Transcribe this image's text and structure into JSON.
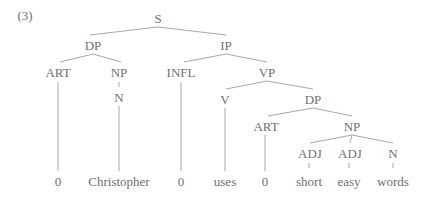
{
  "example_number": "(3)",
  "tree": {
    "nodes": [
      {
        "id": "S",
        "label": "S",
        "x": 158,
        "y": 18
      },
      {
        "id": "DP1",
        "label": "DP",
        "x": 93,
        "y": 45
      },
      {
        "id": "IP",
        "label": "IP",
        "x": 226,
        "y": 45
      },
      {
        "id": "ART1",
        "label": "ART",
        "x": 58,
        "y": 72
      },
      {
        "id": "NP1",
        "label": "NP",
        "x": 119,
        "y": 72
      },
      {
        "id": "N1",
        "label": "N",
        "x": 119,
        "y": 97
      },
      {
        "id": "INFL",
        "label": "INFL",
        "x": 181,
        "y": 72
      },
      {
        "id": "VP",
        "label": "VP",
        "x": 267,
        "y": 72
      },
      {
        "id": "V",
        "label": "V",
        "x": 225,
        "y": 99
      },
      {
        "id": "DP2",
        "label": "DP",
        "x": 313,
        "y": 99
      },
      {
        "id": "ART2",
        "label": "ART",
        "x": 266,
        "y": 126
      },
      {
        "id": "NP2",
        "label": "NP",
        "x": 352,
        "y": 126
      },
      {
        "id": "ADJ1",
        "label": "ADJ",
        "x": 310,
        "y": 153
      },
      {
        "id": "ADJ2",
        "label": "ADJ",
        "x": 350,
        "y": 153
      },
      {
        "id": "N2",
        "label": "N",
        "x": 393,
        "y": 153
      },
      {
        "id": "w1",
        "label": "0",
        "x": 58,
        "y": 181
      },
      {
        "id": "w2",
        "label": "Christopher",
        "x": 119,
        "y": 181
      },
      {
        "id": "w3",
        "label": "0",
        "x": 181,
        "y": 181
      },
      {
        "id": "w4",
        "label": "uses",
        "x": 225,
        "y": 181
      },
      {
        "id": "w5",
        "label": "0",
        "x": 265,
        "y": 181
      },
      {
        "id": "w6",
        "label": "short",
        "x": 309,
        "y": 181
      },
      {
        "id": "w7",
        "label": "easy",
        "x": 349,
        "y": 181
      },
      {
        "id": "w8",
        "label": "words",
        "x": 393,
        "y": 181
      }
    ],
    "edges": [
      {
        "x1": 158,
        "y1": 27,
        "x2": 90,
        "y2": 35
      },
      {
        "x1": 158,
        "y1": 27,
        "x2": 226,
        "y2": 35
      },
      {
        "x1": 93,
        "y1": 54,
        "x2": 60,
        "y2": 62
      },
      {
        "x1": 93,
        "y1": 54,
        "x2": 121,
        "y2": 62
      },
      {
        "x1": 226,
        "y1": 54,
        "x2": 184,
        "y2": 62
      },
      {
        "x1": 226,
        "y1": 54,
        "x2": 267,
        "y2": 62
      },
      {
        "x1": 119,
        "y1": 82,
        "x2": 119,
        "y2": 87
      },
      {
        "x1": 267,
        "y1": 81,
        "x2": 226,
        "y2": 89
      },
      {
        "x1": 267,
        "y1": 81,
        "x2": 313,
        "y2": 89
      },
      {
        "x1": 313,
        "y1": 108,
        "x2": 268,
        "y2": 116
      },
      {
        "x1": 313,
        "y1": 108,
        "x2": 352,
        "y2": 116
      },
      {
        "x1": 352,
        "y1": 135,
        "x2": 310,
        "y2": 143
      },
      {
        "x1": 352,
        "y1": 135,
        "x2": 350,
        "y2": 143
      },
      {
        "x1": 352,
        "y1": 135,
        "x2": 393,
        "y2": 143
      },
      {
        "x1": 58,
        "y1": 82,
        "x2": 58,
        "y2": 171
      },
      {
        "x1": 119,
        "y1": 106,
        "x2": 119,
        "y2": 171
      },
      {
        "x1": 181,
        "y1": 82,
        "x2": 181,
        "y2": 171
      },
      {
        "x1": 225,
        "y1": 108,
        "x2": 225,
        "y2": 171
      },
      {
        "x1": 265,
        "y1": 135,
        "x2": 265,
        "y2": 171
      },
      {
        "x1": 309,
        "y1": 163,
        "x2": 309,
        "y2": 168
      },
      {
        "x1": 349,
        "y1": 163,
        "x2": 349,
        "y2": 168
      },
      {
        "x1": 393,
        "y1": 163,
        "x2": 393,
        "y2": 168
      }
    ]
  }
}
